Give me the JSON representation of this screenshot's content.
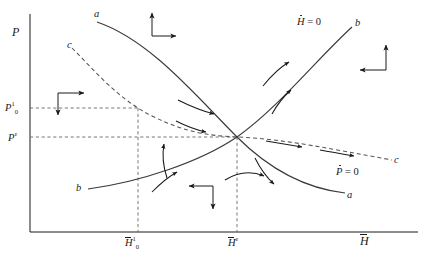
{
  "figure": {
    "type": "phase-diagram"
  },
  "axes": {
    "y_axis_label": "P",
    "x_axis_label_base": "H",
    "x_axis_label_bar": true,
    "origin": {
      "x": 30,
      "y": 232
    },
    "x_end": 418,
    "y_top": 14
  },
  "ticks": {
    "y": [
      {
        "name": "P-one-zero",
        "base": "P",
        "sup": "1",
        "sub": "0",
        "value_y": 108
      },
      {
        "name": "P-e",
        "base": "P",
        "sup": "ε",
        "sub": "",
        "value_y": 137
      }
    ],
    "x": [
      {
        "name": "H-one-zero",
        "base": "H",
        "bar": true,
        "sup": "1",
        "sub": "0",
        "value_x": 138
      },
      {
        "name": "H-e",
        "base": "H",
        "bar": true,
        "sup": "ε",
        "sub": "",
        "value_x": 237
      }
    ]
  },
  "curves": [
    {
      "name": "p-dot-zero-schedule",
      "style": "solid",
      "end_labels": [
        "a",
        "a"
      ],
      "equation_label": {
        "base": "P",
        "dot": true,
        "rhs": "= 0"
      },
      "slope": "downward"
    },
    {
      "name": "h-dot-zero-schedule",
      "style": "solid",
      "end_labels": [
        "b",
        "b"
      ],
      "equation_label": {
        "base": "H",
        "dot": true,
        "rhs": "= 0"
      },
      "slope": "upward"
    },
    {
      "name": "saddle-path",
      "style": "dashed",
      "end_labels": [
        "c",
        "c"
      ],
      "equation_label": null,
      "slope": "downward"
    }
  ],
  "curve_labels": {
    "a_upper_left": "a",
    "a_lower_right": "a",
    "b_upper_right": "b",
    "b_lower_left": "b",
    "c_upper_left": "c",
    "c_lower_right": "c"
  },
  "equation_labels": {
    "h_dot_zero": {
      "base": "H",
      "rhs": "= 0"
    },
    "p_dot_zero": {
      "base": "P",
      "rhs": "= 0"
    }
  },
  "direction_fields": [
    {
      "name": "quadrant-north",
      "arrows": [
        "up",
        "right"
      ],
      "x": 152,
      "y": 20
    },
    {
      "name": "quadrant-east",
      "arrows": [
        "up",
        "left"
      ],
      "x": 362,
      "y": 48
    },
    {
      "name": "quadrant-west",
      "arrows": [
        "right",
        "down"
      ],
      "x": 52,
      "y": 96
    },
    {
      "name": "quadrant-south",
      "arrows": [
        "left",
        "down"
      ],
      "x": 196,
      "y": 184
    }
  ],
  "motion_arrows": [
    {
      "name": "motion-a-upper",
      "on": "a-curve",
      "direction": "down-right"
    },
    {
      "name": "motion-a-lower",
      "on": "a-curve",
      "direction": "down-right"
    },
    {
      "name": "motion-b-upper",
      "on": "b-curve",
      "direction": "up-right"
    },
    {
      "name": "motion-b-lower",
      "on": "b-curve",
      "direction": "up-right"
    },
    {
      "name": "motion-c-upper",
      "on": "c-curve",
      "direction": "down-right"
    },
    {
      "name": "motion-c-lower",
      "on": "c-curve",
      "direction": "down-right"
    },
    {
      "name": "motion-saddle-in",
      "on": "trajectory",
      "direction": "inward"
    },
    {
      "name": "motion-saddle-out",
      "on": "trajectory",
      "direction": "outward"
    }
  ],
  "colors": {
    "ink": "#1a1a1a",
    "curve": "#3a3a3a",
    "dashed": "#555555",
    "background": "#ffffff"
  }
}
